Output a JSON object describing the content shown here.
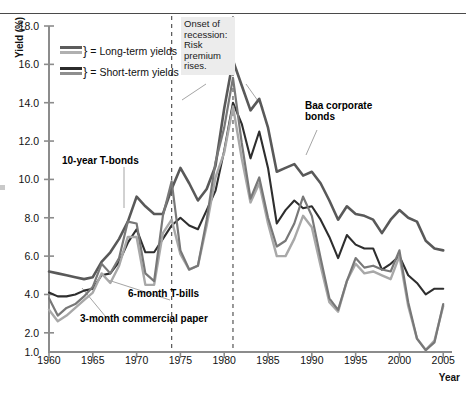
{
  "axes": {
    "ylabel": "Yield (%)",
    "xlabel": "Year",
    "yticks": [
      "18.0",
      "16.0",
      "14.0",
      "12.0",
      "10.0",
      "8.0",
      "6.0",
      "4.0",
      "2.0",
      "1.0"
    ],
    "xticks": [
      "1960",
      "1965",
      "1970",
      "1975",
      "1980",
      "1985",
      "1990",
      "1995",
      "2000",
      "2005"
    ]
  },
  "legend": {
    "rows": [
      {
        "label": "= Long-term yields",
        "brace": "}",
        "color_top": "#5c5c5c",
        "color_bottom": "#b0b0b0"
      },
      {
        "label": "= Short-term yields",
        "brace": "}",
        "color_top": "#2b2b2b",
        "color_bottom": "#8e8e8e"
      }
    ]
  },
  "annotations": {
    "recession": "Onset of recession: Risk premium rises.",
    "tbonds": "10-year T-bonds",
    "tbills": "6-month T-bills",
    "cpaper": "3-month commercial paper",
    "baa": "Baa corporate bonds"
  },
  "chart_data": {
    "type": "line",
    "title": "",
    "xlabel": "Year",
    "ylabel": "Yield (%)",
    "xlim": [
      1960,
      2006
    ],
    "ylim": [
      1.0,
      18.0
    ],
    "grid": false,
    "legend_position": "upper-left",
    "vertical_markers": [
      {
        "year": 1974,
        "style": "dashed",
        "note": "Onset of recession: Risk premium rises."
      },
      {
        "year": 1981,
        "style": "dashed",
        "note": "Onset of recession: Risk premium rises."
      }
    ],
    "x": [
      1960,
      1961,
      1962,
      1963,
      1964,
      1965,
      1966,
      1967,
      1968,
      1969,
      1970,
      1971,
      1972,
      1973,
      1974,
      1975,
      1976,
      1977,
      1978,
      1979,
      1980,
      1981,
      1982,
      1983,
      1984,
      1985,
      1986,
      1987,
      1988,
      1989,
      1990,
      1991,
      1992,
      1993,
      1994,
      1995,
      1996,
      1997,
      1998,
      1999,
      2000,
      2001,
      2002,
      2003,
      2004,
      2005
    ],
    "series": [
      {
        "name": "Baa corporate bonds",
        "color": "#595959",
        "width": 2.6,
        "values": [
          5.2,
          5.1,
          5.0,
          4.9,
          4.8,
          4.9,
          5.7,
          6.2,
          6.9,
          7.8,
          9.1,
          8.6,
          8.2,
          8.2,
          9.5,
          10.6,
          9.8,
          8.9,
          9.5,
          10.7,
          13.7,
          16.2,
          14.9,
          13.6,
          14.2,
          12.7,
          10.4,
          10.6,
          10.8,
          10.2,
          10.4,
          9.8,
          8.9,
          7.9,
          8.6,
          8.2,
          8.1,
          7.9,
          7.2,
          7.9,
          8.4,
          8.0,
          7.8,
          6.8,
          6.4,
          6.3
        ]
      },
      {
        "name": "10-year T-bonds",
        "color": "#2e2e2e",
        "width": 2.1,
        "values": [
          4.1,
          3.9,
          3.9,
          4.0,
          4.2,
          4.3,
          5.0,
          5.1,
          5.7,
          6.7,
          7.4,
          6.2,
          6.2,
          6.9,
          7.6,
          8.0,
          7.6,
          7.4,
          8.4,
          9.4,
          11.5,
          14.0,
          12.9,
          11.1,
          12.5,
          10.6,
          7.7,
          8.4,
          8.9,
          8.5,
          8.6,
          7.9,
          7.0,
          5.9,
          7.1,
          6.6,
          6.4,
          6.4,
          5.3,
          5.6,
          6.0,
          5.0,
          4.6,
          4.0,
          4.3,
          4.3
        ]
      },
      {
        "name": "6-month T-bills",
        "color": "#a8a8a8",
        "width": 2.4,
        "values": [
          3.2,
          2.6,
          2.9,
          3.3,
          3.7,
          4.1,
          5.1,
          4.6,
          5.5,
          7.0,
          7.0,
          4.5,
          4.5,
          7.2,
          7.9,
          6.1,
          5.3,
          5.5,
          7.6,
          10.1,
          11.4,
          13.8,
          11.1,
          8.8,
          9.8,
          7.7,
          6.0,
          6.0,
          6.9,
          8.1,
          7.5,
          5.5,
          3.6,
          3.1,
          4.7,
          5.6,
          5.1,
          5.2,
          5.0,
          4.8,
          6.0,
          3.4,
          1.7,
          1.1,
          1.6,
          3.4
        ]
      },
      {
        "name": "3-month commercial paper",
        "color": "#787878",
        "width": 2.2,
        "values": [
          3.8,
          2.9,
          3.3,
          3.5,
          3.9,
          4.4,
          5.6,
          5.1,
          5.9,
          7.8,
          7.7,
          5.1,
          4.7,
          8.1,
          9.9,
          6.3,
          5.3,
          5.5,
          7.9,
          10.9,
          12.7,
          15.3,
          11.9,
          9.0,
          10.1,
          8.0,
          6.5,
          6.8,
          7.7,
          9.1,
          8.1,
          5.9,
          3.8,
          3.2,
          4.7,
          5.9,
          5.4,
          5.5,
          5.3,
          5.2,
          6.3,
          3.6,
          1.7,
          1.1,
          1.5,
          3.5
        ]
      }
    ]
  }
}
